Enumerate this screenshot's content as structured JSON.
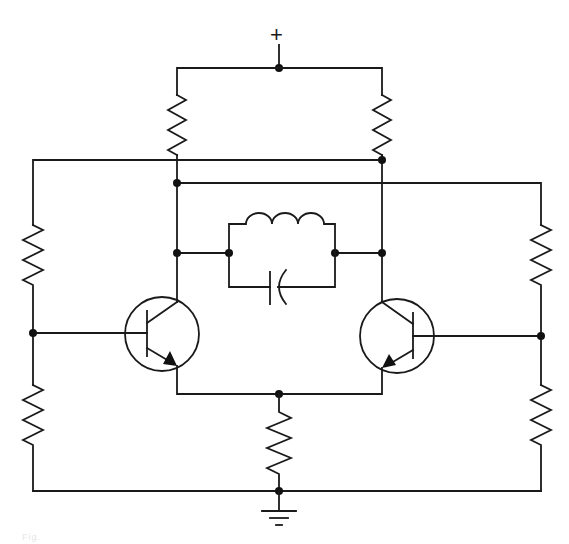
{
  "diagram": {
    "type": "circuit-schematic",
    "supply_label": "+",
    "ground_label": "ground",
    "caption": "Fig.",
    "colors": {
      "line": "#1a1a1a",
      "background": "#ffffff"
    },
    "components": {
      "resistors": [
        {
          "id": "R-collector-left",
          "position": "top-left"
        },
        {
          "id": "R-collector-right",
          "position": "top-right"
        },
        {
          "id": "R-bias-left-upper",
          "position": "left-upper"
        },
        {
          "id": "R-bias-left-lower",
          "position": "left-lower"
        },
        {
          "id": "R-bias-right-upper",
          "position": "right-upper"
        },
        {
          "id": "R-bias-right-lower",
          "position": "right-lower"
        },
        {
          "id": "R-emitter",
          "position": "bottom-center"
        }
      ],
      "transistors": [
        {
          "id": "Q1",
          "type": "NPN",
          "position": "left"
        },
        {
          "id": "Q2",
          "type": "NPN",
          "position": "right"
        }
      ],
      "inductor": {
        "id": "L1",
        "turns": 3
      },
      "capacitor": {
        "id": "C1"
      }
    }
  }
}
